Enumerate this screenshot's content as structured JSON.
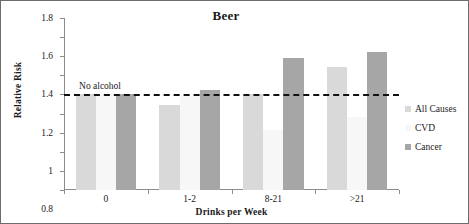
{
  "chart_data": {
    "type": "bar",
    "title": "Beer",
    "xlabel": "Drinks per Week",
    "ylabel": "Relative Risk",
    "categories": [
      "0",
      "1-2",
      "8-21",
      ">21"
    ],
    "series": [
      {
        "name": "All Causes",
        "color": "#d9d9d9",
        "values": [
          1.0,
          0.89,
          1.0,
          1.29
        ]
      },
      {
        "name": "CVD",
        "color": "#f7f7f7",
        "values": [
          1.0,
          0.98,
          0.63,
          0.76
        ]
      },
      {
        "name": "Cancer",
        "color": "#a6a6a6",
        "values": [
          1.0,
          1.05,
          1.38,
          1.44
        ]
      }
    ],
    "ylim": [
      0,
      1.8
    ],
    "ytick_labels": [
      "0",
      "0.2",
      "0.4",
      "0.6",
      "0.8",
      "1",
      "1.2",
      "1.4",
      "1.6",
      "1.8"
    ],
    "ytick_values": [
      0,
      0.2,
      0.4,
      0.6,
      0.8,
      1.0,
      1.2,
      1.4,
      1.6,
      1.8
    ],
    "grid": false,
    "legend_position": "right",
    "annotations": [
      {
        "text": "No alcohol",
        "value": 1.0,
        "style": "dashed-reference-line",
        "color": "#111111"
      }
    ]
  }
}
